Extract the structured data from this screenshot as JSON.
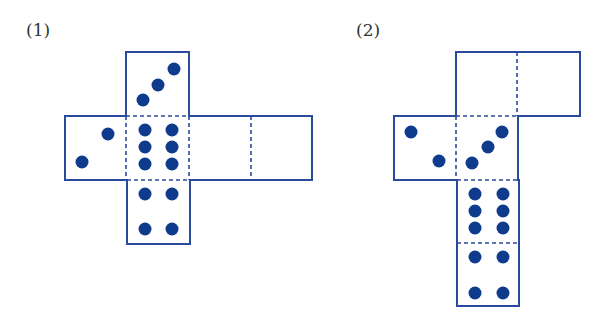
{
  "colors": {
    "stroke": "#2a4a9c",
    "dot": "#0f3b8c",
    "label": "#333333",
    "background": "#ffffff"
  },
  "figures": [
    {
      "label": "(1)",
      "label_pos": [
        26,
        20
      ],
      "faces": [
        {
          "x": 126,
          "y": 52,
          "w": 63,
          "h": 64,
          "pips": [
            [
              174,
              69
            ],
            [
              158,
              85
            ],
            [
              143,
              100
            ]
          ]
        },
        {
          "x": 65,
          "y": 116,
          "w": 61,
          "h": 64,
          "pips": [
            [
              108,
              134
            ],
            [
              82,
              162
            ]
          ]
        },
        {
          "x": 126,
          "y": 116,
          "w": 63,
          "h": 64,
          "pips": [
            [
              145,
              130
            ],
            [
              172,
              130
            ],
            [
              145,
              147
            ],
            [
              172,
              147
            ],
            [
              145,
              164
            ],
            [
              172,
              164
            ]
          ]
        },
        {
          "x": 189,
          "y": 116,
          "w": 62,
          "h": 64,
          "pips": []
        },
        {
          "x": 251,
          "y": 116,
          "w": 61,
          "h": 64,
          "pips": []
        },
        {
          "x": 127,
          "y": 180,
          "w": 63,
          "h": 64,
          "pips": [
            [
              145,
              194
            ],
            [
              172,
              194
            ],
            [
              145,
              229
            ],
            [
              172,
              229
            ]
          ]
        }
      ],
      "outline": "M126,52 L189,52 L189,116 L312,116 L312,180 L190,180 L190,244 L127,244 L127,180 L65,180 L65,116 L126,116 Z",
      "folds": [
        [
          126,
          116,
          189,
          116
        ],
        [
          126,
          116,
          126,
          180
        ],
        [
          189,
          116,
          189,
          180
        ],
        [
          127,
          180,
          190,
          180
        ],
        [
          251,
          116,
          251,
          180
        ]
      ]
    },
    {
      "label": "(2)",
      "label_pos": [
        356,
        20
      ],
      "faces": [
        {
          "x": 456,
          "y": 52,
          "w": 61,
          "h": 64,
          "pips": []
        },
        {
          "x": 517,
          "y": 52,
          "w": 63,
          "h": 64,
          "pips": []
        },
        {
          "x": 394,
          "y": 116,
          "w": 62,
          "h": 64,
          "pips": [
            [
              411,
              132
            ],
            [
              439,
              161
            ]
          ]
        },
        {
          "x": 456,
          "y": 116,
          "w": 62,
          "h": 64,
          "pips": [
            [
              502,
              132
            ],
            [
              488,
              147
            ],
            [
              472,
              163
            ]
          ]
        },
        {
          "x": 457,
          "y": 180,
          "w": 62,
          "h": 63,
          "pips": [
            [
              475,
              194
            ],
            [
              503,
              194
            ],
            [
              475,
              211
            ],
            [
              503,
              211
            ],
            [
              475,
              228
            ],
            [
              503,
              228
            ]
          ]
        },
        {
          "x": 457,
          "y": 243,
          "w": 62,
          "h": 63,
          "pips": [
            [
              475,
              257
            ],
            [
              503,
              257
            ],
            [
              475,
              293
            ],
            [
              503,
              293
            ]
          ]
        }
      ],
      "outline": "M456,52 L580,52 L580,116 L518,116 L518,180 L519,180 L519,306 L457,306 L457,180 L394,180 L394,116 L456,116 Z",
      "folds": [
        [
          517,
          52,
          517,
          116
        ],
        [
          456,
          116,
          518,
          116
        ],
        [
          456,
          116,
          456,
          180
        ],
        [
          457,
          180,
          519,
          180
        ],
        [
          457,
          243,
          519,
          243
        ]
      ]
    }
  ]
}
